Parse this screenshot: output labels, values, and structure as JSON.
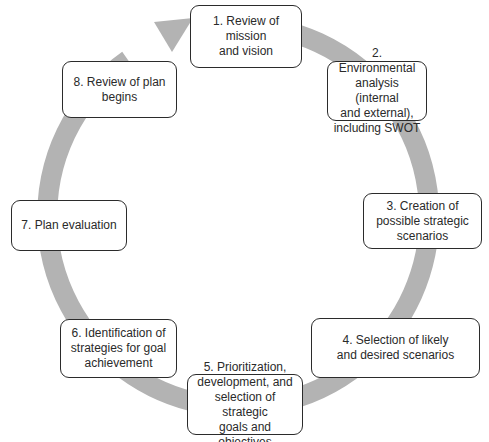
{
  "diagram": {
    "type": "cycle",
    "arrow_color": "#b3b3b3",
    "box_border_color": "#2b2b2b",
    "text_color": "#2a2a2a",
    "steps": [
      {
        "label": "1. Review of mission\nand vision"
      },
      {
        "label": "2. Environmental\nanalysis (internal\nand external),\nincluding SWOT"
      },
      {
        "label": "3. Creation of\npossible strategic\nscenarios"
      },
      {
        "label": "4. Selection of likely\nand desired scenarios"
      },
      {
        "label": "5. Prioritization,\ndevelopment, and\nselection of strategic\ngoals and objectives"
      },
      {
        "label": "6. Identification of\nstrategies for goal\nachievement"
      },
      {
        "label": "7. Plan evaluation"
      },
      {
        "label": "8. Review of plan\nbegins"
      }
    ]
  }
}
